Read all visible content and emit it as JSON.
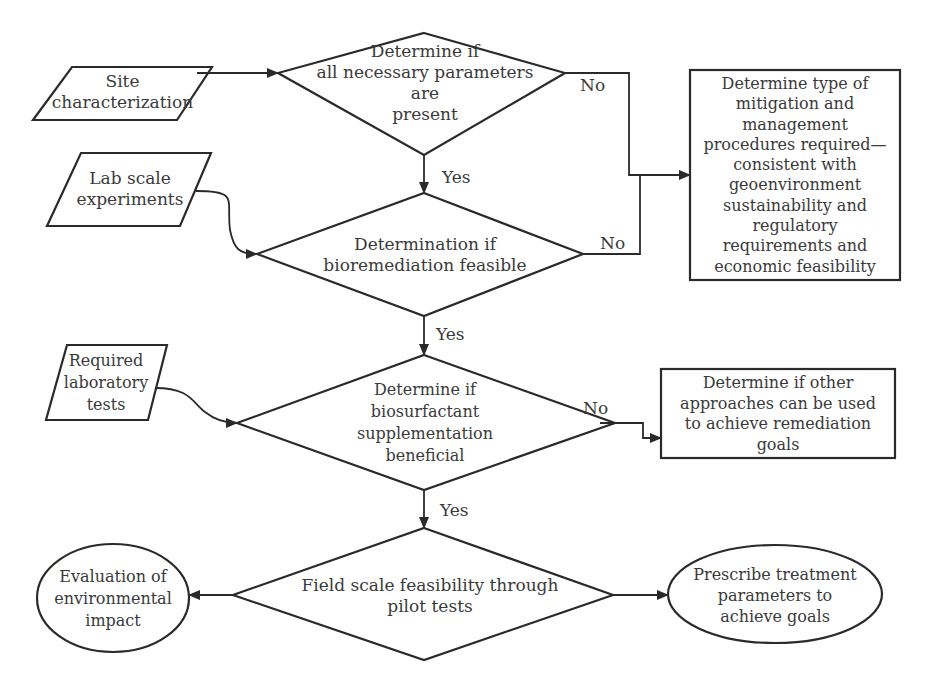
{
  "diagram": {
    "type": "flowchart",
    "line_color": "#2a2a2a",
    "text_color": "#3a3a3a",
    "nodes": {
      "site_characterization": {
        "shape": "parallelogram",
        "text": "Site\ncharacterization"
      },
      "lab_scale": {
        "shape": "parallelogram",
        "text": "Lab scale\nexperiments"
      },
      "required_tests": {
        "shape": "parallelogram",
        "text": "Required\nlaboratory\ntests"
      },
      "decision_parameters": {
        "shape": "diamond",
        "text": "Determine if\nall necessary parameters are\npresent"
      },
      "decision_bioremediation": {
        "shape": "diamond",
        "text": "Determination if\nbioremediation feasible"
      },
      "decision_biosurfactant": {
        "shape": "diamond",
        "text": "Determine if\nbiosurfactant\nsupplementation\nbeneficial"
      },
      "decision_field": {
        "shape": "diamond",
        "text": "Field scale feasibility through\npilot tests"
      },
      "mitigation_box": {
        "shape": "rectangle",
        "text": "Determine type of\nmitigation and\nmanagement\nprocedures required—\nconsistent  with\ngeoenvironment\nsustainability  and\nregulatory\nrequirements and\neconomic feasibility"
      },
      "other_approaches_box": {
        "shape": "rectangle",
        "text": "Determine if other\napproaches can be used\nto achieve remediation\ngoals"
      },
      "environmental_impact": {
        "shape": "ellipse",
        "text": "Evaluation of\nenvironmental\nimpact"
      },
      "prescribe_treatment": {
        "shape": "ellipse",
        "text": "Prescribe treatment\nparameters to\nachieve goals"
      }
    },
    "edges": [
      {
        "from": "site_characterization",
        "to": "decision_parameters",
        "label": ""
      },
      {
        "from": "decision_parameters",
        "to": "decision_bioremediation",
        "label": "Yes"
      },
      {
        "from": "decision_parameters",
        "to": "mitigation_box",
        "label": "No"
      },
      {
        "from": "lab_scale",
        "to": "decision_bioremediation",
        "label": ""
      },
      {
        "from": "decision_bioremediation",
        "to": "mitigation_box",
        "label": "No"
      },
      {
        "from": "decision_bioremediation",
        "to": "decision_biosurfactant",
        "label": "Yes"
      },
      {
        "from": "required_tests",
        "to": "decision_biosurfactant",
        "label": ""
      },
      {
        "from": "decision_biosurfactant",
        "to": "other_approaches_box",
        "label": "No"
      },
      {
        "from": "decision_biosurfactant",
        "to": "decision_field",
        "label": "Yes"
      },
      {
        "from": "decision_field",
        "to": "environmental_impact",
        "label": ""
      },
      {
        "from": "decision_field",
        "to": "prescribe_treatment",
        "label": ""
      }
    ]
  }
}
